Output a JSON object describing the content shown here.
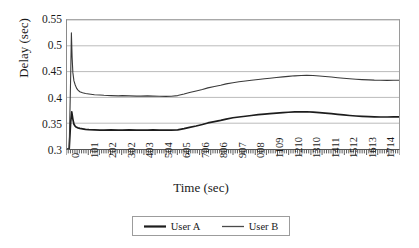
{
  "chart_data": {
    "type": "line",
    "title": "",
    "xlabel": "Time (sec)",
    "ylabel": "Delay (sec)",
    "xlim": [
      0,
      1815
    ],
    "ylim": [
      0.3,
      0.55
    ],
    "grid": true,
    "legend_position": "bottom",
    "y_ticks": [
      "0.3",
      "0.35",
      "0.4",
      "0.45",
      "0.5",
      "0.55"
    ],
    "y_tick_values": [
      0.3,
      0.35,
      0.4,
      0.45,
      0.5,
      0.55
    ],
    "x_tick_labels": [
      "0",
      "101",
      "202",
      "302",
      "403",
      "504",
      "605",
      "706",
      "806",
      "907",
      "008",
      "1109",
      "1210",
      "1310",
      "1411",
      "1512",
      "1613",
      "1714"
    ],
    "x_tick_values": [
      0,
      101,
      202,
      302,
      403,
      504,
      605,
      706,
      806,
      907,
      1008,
      1109,
      1210,
      1310,
      1411,
      1512,
      1613,
      1714
    ],
    "series": [
      {
        "name": "User A",
        "color": "#1d1d1d",
        "width": 1.7,
        "x": [
          0,
          12,
          20,
          26,
          32,
          38,
          45,
          52,
          60,
          70,
          85,
          101,
          120,
          150,
          180,
          202,
          240,
          280,
          302,
          340,
          380,
          403,
          440,
          470,
          504,
          540,
          570,
          605,
          640,
          670,
          706,
          740,
          770,
          806,
          840,
          870,
          907,
          940,
          975,
          1008,
          1045,
          1080,
          1109,
          1145,
          1180,
          1210,
          1245,
          1280,
          1310,
          1345,
          1380,
          1411,
          1445,
          1480,
          1512,
          1545,
          1580,
          1613,
          1650,
          1680,
          1714,
          1750,
          1785,
          1815
        ],
        "y": [
          0.3,
          0.3,
          0.352,
          0.372,
          0.358,
          0.348,
          0.344,
          0.342,
          0.341,
          0.34,
          0.339,
          0.338,
          0.3375,
          0.337,
          0.3365,
          0.3365,
          0.337,
          0.3365,
          0.3365,
          0.337,
          0.3365,
          0.3365,
          0.3365,
          0.337,
          0.3365,
          0.3365,
          0.3365,
          0.337,
          0.3395,
          0.342,
          0.3445,
          0.3475,
          0.3505,
          0.353,
          0.3555,
          0.358,
          0.3605,
          0.362,
          0.3635,
          0.365,
          0.3665,
          0.3675,
          0.3685,
          0.3695,
          0.3705,
          0.3712,
          0.3718,
          0.372,
          0.3722,
          0.3715,
          0.3705,
          0.3695,
          0.3685,
          0.3672,
          0.366,
          0.365,
          0.364,
          0.3632,
          0.3626,
          0.3622,
          0.362,
          0.362,
          0.3622,
          0.3622
        ]
      },
      {
        "name": "User B",
        "color": "#3a3a3a",
        "width": 1.1,
        "x": [
          0,
          12,
          20,
          24,
          28,
          32,
          38,
          45,
          52,
          60,
          70,
          85,
          101,
          120,
          150,
          180,
          202,
          240,
          280,
          302,
          340,
          380,
          403,
          440,
          470,
          504,
          540,
          570,
          605,
          640,
          670,
          706,
          740,
          770,
          806,
          840,
          870,
          907,
          940,
          975,
          1008,
          1045,
          1080,
          1109,
          1145,
          1180,
          1210,
          1245,
          1280,
          1310,
          1345,
          1380,
          1411,
          1445,
          1480,
          1512,
          1545,
          1580,
          1613,
          1650,
          1680,
          1714,
          1750,
          1785,
          1815
        ],
        "y": [
          0.3,
          0.3,
          0.44,
          0.525,
          0.478,
          0.448,
          0.432,
          0.424,
          0.418,
          0.414,
          0.411,
          0.409,
          0.4075,
          0.4065,
          0.405,
          0.4045,
          0.404,
          0.4035,
          0.403,
          0.4035,
          0.403,
          0.4025,
          0.4025,
          0.403,
          0.4025,
          0.4022,
          0.402,
          0.4022,
          0.4035,
          0.4065,
          0.4095,
          0.4125,
          0.4155,
          0.4185,
          0.421,
          0.4235,
          0.4262,
          0.4285,
          0.4302,
          0.4318,
          0.4332,
          0.4348,
          0.436,
          0.4372,
          0.4385,
          0.4398,
          0.4408,
          0.4418,
          0.4425,
          0.443,
          0.4425,
          0.4415,
          0.4405,
          0.4395,
          0.4382,
          0.437,
          0.436,
          0.4352,
          0.4345,
          0.434,
          0.4335,
          0.4332,
          0.433,
          0.4332,
          0.4332
        ]
      }
    ]
  },
  "legend": {
    "items": [
      {
        "label": "User A"
      },
      {
        "label": "User B"
      }
    ]
  }
}
